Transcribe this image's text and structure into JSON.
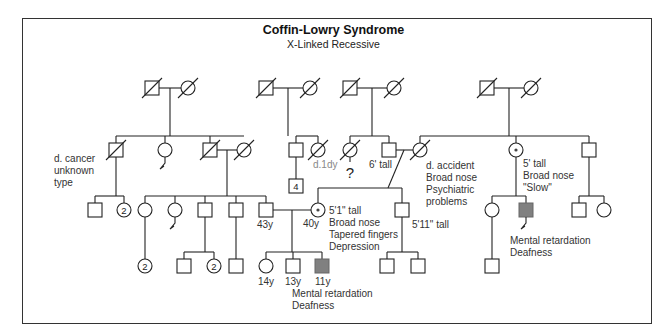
{
  "title": "Coffin-Lowry Syndrome",
  "subtitle": "X-Linked Recessive",
  "colors": {
    "line": "#222222",
    "affected": "#808080",
    "gray_text": "#888888",
    "frame": "#333333"
  },
  "legend_symbols": {
    "square": "male",
    "circle": "female",
    "slash": "deceased",
    "dot-circle": "carrier female",
    "filled-square": "affected male",
    "number-in-symbol": "multiple individuals",
    "zigzag-line": "miscarriage / no offspring"
  },
  "individuals": [
    {
      "id": "g1a",
      "sex": "M",
      "x": 152,
      "y": 88,
      "deceased": true
    },
    {
      "id": "g1b",
      "sex": "F",
      "x": 188,
      "y": 88,
      "deceased": true
    },
    {
      "id": "g1c",
      "sex": "M",
      "x": 266,
      "y": 88,
      "deceased": true
    },
    {
      "id": "g1d",
      "sex": "F",
      "x": 310,
      "y": 88,
      "deceased": true
    },
    {
      "id": "g1e",
      "sex": "M",
      "x": 350,
      "y": 88,
      "deceased": true
    },
    {
      "id": "g1f",
      "sex": "F",
      "x": 394,
      "y": 88,
      "deceased": true
    },
    {
      "id": "g1g",
      "sex": "M",
      "x": 487,
      "y": 88,
      "deceased": true
    },
    {
      "id": "g1h",
      "sex": "F",
      "x": 531,
      "y": 88,
      "deceased": true
    },
    {
      "id": "g2a",
      "sex": "M",
      "x": 116,
      "y": 150,
      "deceased": true,
      "label": [
        "d. cancer",
        "unknown",
        "type"
      ],
      "label_pos": "left"
    },
    {
      "id": "g2b",
      "sex": "F",
      "x": 165,
      "y": 150,
      "zigzag": true
    },
    {
      "id": "g2c",
      "sex": "M",
      "x": 210,
      "y": 150,
      "deceased": true
    },
    {
      "id": "g2d",
      "sex": "F",
      "x": 244,
      "y": 150,
      "deceased": true
    },
    {
      "id": "g2e",
      "sex": "M",
      "x": 296,
      "y": 150
    },
    {
      "id": "g2f",
      "sex": "F",
      "x": 318,
      "y": 150,
      "deceased": true,
      "label": [
        "d.1dy"
      ],
      "label_gray": true
    },
    {
      "id": "g2g",
      "sex": "F",
      "x": 350,
      "y": 150,
      "deceased": true,
      "question": true
    },
    {
      "id": "g2h",
      "sex": "M",
      "x": 389,
      "y": 150,
      "label": [
        "6' tall"
      ]
    },
    {
      "id": "g2i",
      "sex": "F",
      "x": 420,
      "y": 150,
      "deceased": true,
      "label": [
        "d. accident",
        "Broad nose",
        "Psychiatric",
        "problems"
      ]
    },
    {
      "id": "g2j",
      "sex": "F",
      "x": 516,
      "y": 150,
      "carrier": true,
      "label": [
        "5' tall",
        "Broad nose",
        "\"Slow\""
      ]
    },
    {
      "id": "g2k",
      "sex": "M",
      "x": 589,
      "y": 150
    },
    {
      "id": "g3a",
      "sex": "M",
      "x": 95,
      "y": 210
    },
    {
      "id": "g3b",
      "sex": "F",
      "x": 124,
      "y": 210,
      "count": "2"
    },
    {
      "id": "g3c",
      "sex": "F",
      "x": 145,
      "y": 210
    },
    {
      "id": "g3d",
      "sex": "F",
      "x": 175,
      "y": 210,
      "zigzag": true
    },
    {
      "id": "g3e",
      "sex": "M",
      "x": 205,
      "y": 210
    },
    {
      "id": "g3f",
      "sex": "M",
      "x": 236,
      "y": 210
    },
    {
      "id": "g3g",
      "sex": "M",
      "x": 266,
      "y": 210,
      "label": [
        "43y"
      ]
    },
    {
      "id": "g3h",
      "sex": "M",
      "x": 296,
      "y": 186,
      "count": "4"
    },
    {
      "id": "g3i",
      "sex": "F",
      "x": 318,
      "y": 210,
      "carrier": true,
      "label": [
        "5'1\" tall",
        "Broad nose",
        "Tapered fingers",
        "Depression"
      ],
      "age": "40y"
    },
    {
      "id": "g3j",
      "sex": "M",
      "x": 402,
      "y": 210,
      "label": [
        "5'11\" tall"
      ]
    },
    {
      "id": "g3k",
      "sex": "F",
      "x": 492,
      "y": 210
    },
    {
      "id": "g3l",
      "sex": "M",
      "x": 526,
      "y": 210,
      "affected": true,
      "zigzag": true,
      "label": [
        "Mental retardation",
        "Deafness"
      ]
    },
    {
      "id": "g3m",
      "sex": "M",
      "x": 579,
      "y": 210
    },
    {
      "id": "g3n",
      "sex": "F",
      "x": 604,
      "y": 210
    },
    {
      "id": "g4a",
      "sex": "F",
      "x": 145,
      "y": 266,
      "count": "2"
    },
    {
      "id": "g4b",
      "sex": "M",
      "x": 184,
      "y": 266
    },
    {
      "id": "g4c",
      "sex": "F",
      "x": 214,
      "y": 266,
      "count": "2"
    },
    {
      "id": "g4d",
      "sex": "M",
      "x": 236,
      "y": 266
    },
    {
      "id": "g4e",
      "sex": "F",
      "x": 266,
      "y": 266,
      "label": [
        "14y"
      ]
    },
    {
      "id": "g4f",
      "sex": "M",
      "x": 293,
      "y": 266,
      "label": [
        "13y"
      ]
    },
    {
      "id": "g4g",
      "sex": "M",
      "x": 322,
      "y": 266,
      "affected": true,
      "label": [
        "11y",
        "Mental retardation",
        "Deafness"
      ]
    },
    {
      "id": "g4h",
      "sex": "M",
      "x": 387,
      "y": 266
    },
    {
      "id": "g4i",
      "sex": "M",
      "x": 418,
      "y": 266
    },
    {
      "id": "g4j",
      "sex": "M",
      "x": 492,
      "y": 266
    }
  ],
  "lines": [
    [
      159,
      88,
      181,
      88
    ],
    [
      170,
      88,
      170,
      136
    ],
    [
      116,
      136,
      244,
      136
    ],
    [
      116,
      136,
      116,
      143
    ],
    [
      165,
      136,
      165,
      143
    ],
    [
      210,
      136,
      210,
      143
    ],
    [
      273,
      88,
      303,
      88
    ],
    [
      288,
      88,
      288,
      136
    ],
    [
      296,
      136,
      318,
      136
    ],
    [
      296,
      136,
      296,
      143
    ],
    [
      318,
      136,
      318,
      143
    ],
    [
      357,
      88,
      387,
      88
    ],
    [
      372,
      88,
      372,
      136
    ],
    [
      350,
      136,
      389,
      136
    ],
    [
      350,
      136,
      350,
      143
    ],
    [
      389,
      136,
      389,
      143
    ],
    [
      494,
      88,
      524,
      88
    ],
    [
      509,
      88,
      509,
      136
    ],
    [
      420,
      136,
      589,
      136
    ],
    [
      420,
      136,
      420,
      143
    ],
    [
      516,
      136,
      516,
      143
    ],
    [
      589,
      136,
      589,
      143
    ],
    [
      217,
      150,
      237,
      150
    ],
    [
      227,
      150,
      227,
      196
    ],
    [
      145,
      196,
      266,
      196
    ],
    [
      145,
      196,
      145,
      203
    ],
    [
      175,
      196,
      175,
      203
    ],
    [
      205,
      196,
      205,
      203
    ],
    [
      236,
      196,
      236,
      203
    ],
    [
      266,
      196,
      266,
      203
    ],
    [
      116,
      157,
      116,
      196
    ],
    [
      95,
      196,
      124,
      196
    ],
    [
      95,
      196,
      95,
      203
    ],
    [
      124,
      196,
      124,
      203
    ],
    [
      296,
      157,
      296,
      179
    ],
    [
      396,
      150,
      413,
      150
    ],
    [
      404,
      150,
      388,
      188
    ],
    [
      318,
      188,
      402,
      188
    ],
    [
      318,
      188,
      318,
      203
    ],
    [
      402,
      188,
      402,
      203
    ],
    [
      273,
      210,
      311,
      210
    ],
    [
      292,
      210,
      292,
      252
    ],
    [
      266,
      252,
      322,
      252
    ],
    [
      266,
      252,
      266,
      259
    ],
    [
      293,
      252,
      293,
      259
    ],
    [
      322,
      252,
      322,
      259
    ],
    [
      402,
      217,
      402,
      252
    ],
    [
      387,
      252,
      418,
      252
    ],
    [
      387,
      252,
      387,
      259
    ],
    [
      418,
      252,
      418,
      259
    ],
    [
      516,
      157,
      516,
      196
    ],
    [
      492,
      196,
      526,
      196
    ],
    [
      492,
      196,
      492,
      203
    ],
    [
      526,
      196,
      526,
      203
    ],
    [
      589,
      157,
      589,
      196
    ],
    [
      579,
      196,
      604,
      196
    ],
    [
      579,
      196,
      579,
      203
    ],
    [
      604,
      196,
      604,
      203
    ],
    [
      145,
      217,
      145,
      259
    ],
    [
      205,
      217,
      205,
      252
    ],
    [
      184,
      252,
      214,
      252
    ],
    [
      184,
      252,
      184,
      259
    ],
    [
      214,
      252,
      214,
      259
    ],
    [
      236,
      217,
      236,
      259
    ],
    [
      492,
      217,
      492,
      259
    ]
  ]
}
